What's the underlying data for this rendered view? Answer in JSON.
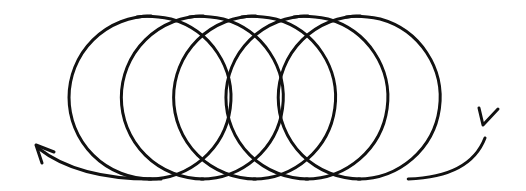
{
  "diagram": {
    "title": "",
    "type": "helical-coil",
    "turns": 5,
    "line_color": "#111111",
    "background": "#ffffff",
    "arrows": [
      {
        "name": "entry-arrow",
        "end": "right",
        "direction": "into-coil"
      },
      {
        "name": "exit-arrow",
        "end": "left",
        "direction": "out-of-coil"
      }
    ],
    "labels": []
  }
}
